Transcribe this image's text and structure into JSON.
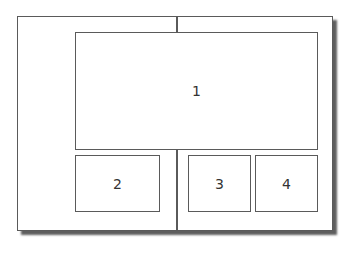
{
  "diagram": {
    "type": "layout-regions",
    "frame": {
      "border_color": "#5a5a5a",
      "shadow": true
    },
    "regions": [
      {
        "id": "1",
        "label": "1"
      },
      {
        "id": "2",
        "label": "2"
      },
      {
        "id": "3",
        "label": "3"
      },
      {
        "id": "4",
        "label": "4"
      }
    ]
  }
}
